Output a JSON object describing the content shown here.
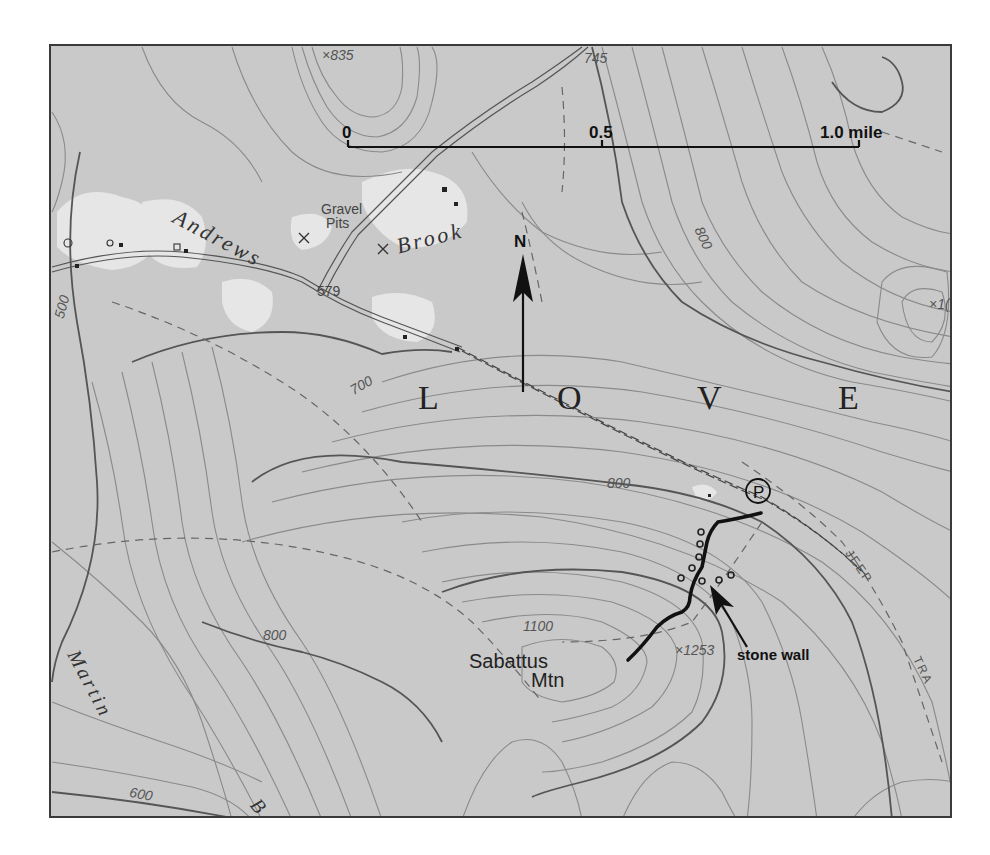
{
  "map": {
    "type": "topographic",
    "scale_bar": {
      "ticks": [
        "0",
        "0.5",
        "1.0 mile"
      ]
    },
    "north_arrow": {
      "label": "N"
    },
    "town_name": [
      "L",
      "O",
      "V",
      "E"
    ],
    "water_features": {
      "andrews_brook": [
        "Andrews",
        "Brook"
      ],
      "martin": "Martin",
      "b_fragment": "B"
    },
    "places": {
      "gravel_pits": [
        "Gravel",
        "Pits"
      ],
      "mountain": [
        "Sabattus",
        "Mtn"
      ],
      "parking": "P"
    },
    "elevations": {
      "spot_835": "×835",
      "spot_745": "745",
      "spot_579": "579",
      "spot_1253": "×1253",
      "spot_edge": "×1("
    },
    "contour_labels": {
      "c500": "500",
      "c600": "600",
      "c700": "700",
      "c800_ne": "800",
      "c800_trail": "800",
      "c800_sw": "800",
      "c1100": "1100"
    },
    "trail_labels": {
      "jeep": "JEEP",
      "trail": "TRA"
    },
    "annotations": {
      "stone_wall": "stone wall"
    },
    "colors": {
      "background": "#c9c9c9",
      "cleared_land": "#e8e8e8",
      "contour": "#7a7a7a",
      "index_contour": "#555555",
      "trail": "#111111",
      "frame": "#3a3a3a"
    }
  }
}
